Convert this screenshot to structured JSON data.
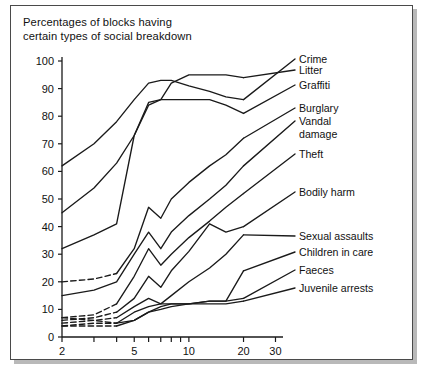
{
  "figure": {
    "title_line1": "Percentages of blocks having",
    "title_line2": "certain types of social breakdown"
  },
  "chart_data": {
    "type": "line",
    "title": "Percentages of blocks having certain types of social breakdown",
    "xlabel": "Number of storeys in the block",
    "ylabel": "",
    "xscale": "log",
    "xlim": [
      2,
      33
    ],
    "ylim": [
      0,
      100
    ],
    "grid": false,
    "legend_position": "right-labels-with-leader-lines",
    "xticks_major": [
      2,
      5,
      10,
      20,
      30
    ],
    "xticks_minor": [
      3,
      4,
      6,
      7,
      8,
      9
    ],
    "yticks": [
      0,
      10,
      20,
      30,
      40,
      50,
      60,
      70,
      80,
      90,
      100
    ],
    "x": [
      2,
      3,
      4,
      5,
      6,
      7,
      8,
      10,
      13,
      16,
      20
    ],
    "series": [
      {
        "name": "Crime",
        "label": "Crime",
        "values": [
          62,
          70,
          78,
          86,
          92,
          93,
          93,
          91,
          89,
          87,
          86
        ],
        "dashed_until_x": null,
        "label_y": 57
      },
      {
        "name": "Litter",
        "label": "Litter",
        "values": [
          45,
          54,
          63,
          73,
          84,
          86,
          92,
          95,
          95,
          95,
          94
        ],
        "dashed_until_x": null,
        "label_y": 68
      },
      {
        "name": "Graffiti",
        "label": "Graffiti",
        "values": [
          32,
          37,
          41,
          73,
          85,
          86,
          86,
          86,
          86,
          84,
          81
        ],
        "dashed_until_x": null,
        "label_y": 83
      },
      {
        "name": "Burglary",
        "label": "Burglary",
        "values": [
          20,
          21,
          23,
          32,
          47,
          43,
          50,
          56,
          62,
          66,
          72
        ],
        "dashed_until_x": 4,
        "label_y": 106
      },
      {
        "name": "Vandal damage",
        "label": "Vandal",
        "label2": "damage",
        "values": [
          15,
          17,
          20,
          30,
          38,
          32,
          38,
          44,
          50,
          55,
          62
        ],
        "dashed_until_x": null,
        "label_y": 119
      },
      {
        "name": "Theft",
        "label": "Theft",
        "values": [
          7,
          8,
          12,
          22,
          32,
          26,
          30,
          36,
          42,
          47,
          52
        ],
        "dashed_until_x": 4,
        "label_y": 152
      },
      {
        "name": "Bodily harm",
        "label": "Bodily harm",
        "values": [
          6,
          7,
          9,
          14,
          22,
          18,
          24,
          31,
          41,
          38,
          40
        ],
        "dashed_until_x": 4,
        "label_y": 190
      },
      {
        "name": "Sexual assaults",
        "label": "Sexual assaults",
        "values": [
          5,
          6,
          7,
          11,
          14,
          12,
          15,
          20,
          25,
          30,
          37
        ],
        "dashed_until_x": 4,
        "label_y": 234
      },
      {
        "name": "Children in care",
        "label": "Children in care",
        "values": [
          4,
          5,
          5,
          9,
          11,
          12,
          12,
          12,
          13,
          13,
          24
        ],
        "dashed_until_x": 4,
        "label_y": 250
      },
      {
        "name": "Faeces",
        "label": "Faeces",
        "values": [
          7,
          6,
          5,
          6,
          9,
          11,
          12,
          12,
          13,
          13,
          14
        ],
        "dashed_until_x": 4,
        "label_y": 268
      },
      {
        "name": "Juvenile arrests",
        "label": "Juvenile arrests",
        "values": [
          4,
          4,
          4,
          6,
          9,
          10,
          11,
          12,
          12,
          12,
          13
        ],
        "dashed_until_x": 4,
        "label_y": 286
      }
    ]
  },
  "colors": {
    "line": "#1a1a1a",
    "frame": "#4a4a4a",
    "background": "#ffffff",
    "shadow": "#b9b9b9"
  }
}
